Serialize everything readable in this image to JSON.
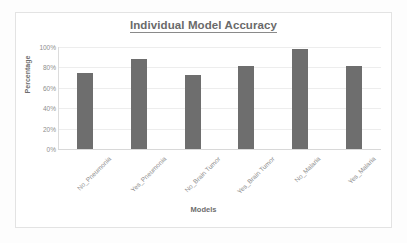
{
  "chart_data": {
    "type": "bar",
    "title": "Individual Model Accuracy",
    "xlabel": "Models",
    "ylabel": "Percentage",
    "categories": [
      "No_Pneumonia",
      "Yes_Pneumonia",
      "No_Brain Tumor",
      "Yes_Brain Tumor",
      "No_Malaria",
      "Yes_Malaria"
    ],
    "values": [
      75,
      88,
      73,
      81,
      98,
      81
    ],
    "ylim": [
      0,
      100
    ],
    "ytick_labels": [
      "100%",
      "80%",
      "60%",
      "40%",
      "20%",
      "0%"
    ],
    "ytick_values": [
      100,
      80,
      60,
      40,
      20,
      0
    ],
    "grid": true,
    "legend": "none",
    "series_color": "#6e6e6e",
    "title_color": "#6a6a6a",
    "gridline_color": "#ededed"
  }
}
